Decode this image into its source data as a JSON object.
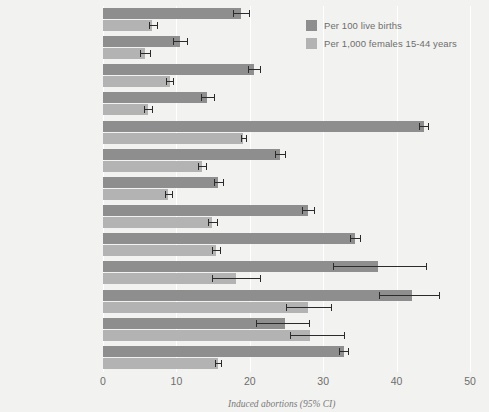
{
  "chart_data": {
    "type": "bar",
    "orientation": "horizontal",
    "title": "",
    "caption": "Induced abortions (95% CI)",
    "xlabel": "",
    "ylabel": "",
    "xlim": [
      0,
      50
    ],
    "xticks": [
      0,
      10,
      20,
      30,
      40,
      50
    ],
    "grid": true,
    "grid_axis": "x",
    "legend_position": "top-right",
    "categories": [
      "Newfoundland",
      "Prince Edward Island",
      "Nova Scotia",
      "New Brunswick",
      "Quebec",
      "Manitoba",
      "Saskatchewan",
      "Alberta",
      "British Columbia",
      "Yukon",
      "Northwest Territories",
      "Nunavut",
      "CANADA***"
    ],
    "series": [
      {
        "name": "Per 100 live births",
        "color": "#8e8e8e",
        "values": [
          18.8,
          10.5,
          20.6,
          14.2,
          43.7,
          24.1,
          15.7,
          27.9,
          34.3,
          37.4,
          42.1,
          24.8,
          32.8
        ],
        "ci_lower": [
          17.7,
          9.6,
          19.8,
          13.4,
          43.1,
          23.4,
          15.1,
          27.1,
          33.6,
          31.3,
          37.6,
          20.9,
          32.2
        ],
        "ci_upper": [
          19.9,
          11.5,
          21.4,
          15.1,
          44.3,
          24.8,
          16.4,
          28.7,
          35.0,
          44.0,
          45.8,
          28.1,
          33.4
        ]
      },
      {
        "name": "Per 1,000 females 15-44 years",
        "color": "#b3b3b3",
        "values": [
          6.7,
          5.7,
          9.1,
          6.1,
          19.1,
          13.5,
          8.9,
          14.9,
          15.4,
          18.1,
          27.9,
          28.2,
          15.7
        ],
        "ci_lower": [
          6.2,
          5.0,
          8.6,
          5.6,
          18.8,
          13.0,
          8.4,
          14.3,
          14.9,
          14.8,
          24.9,
          25.5,
          15.3
        ],
        "ci_upper": [
          7.3,
          6.4,
          9.6,
          6.7,
          19.5,
          14.0,
          9.4,
          15.5,
          15.9,
          21.4,
          31.0,
          32.8,
          16.1
        ]
      }
    ]
  },
  "legend": {
    "items": [
      {
        "label": "Per 100 live births",
        "color": "#8e8e8e"
      },
      {
        "label": "Per 1,000 females 15-44 years",
        "color": "#b3b3b3"
      }
    ]
  },
  "axis": {
    "ticks": [
      "0",
      "10",
      "20",
      "30",
      "40",
      "50"
    ]
  },
  "caption": {
    "text": "Induced abortions (95% CI)"
  },
  "colors": {
    "background": "#f2f2f0",
    "series_dark": "#8e8e8e",
    "series_light": "#b3b3b3",
    "gridline": "#ffffff",
    "label_text": "#5c5c5c",
    "error_bar": "#2b2b2b"
  }
}
